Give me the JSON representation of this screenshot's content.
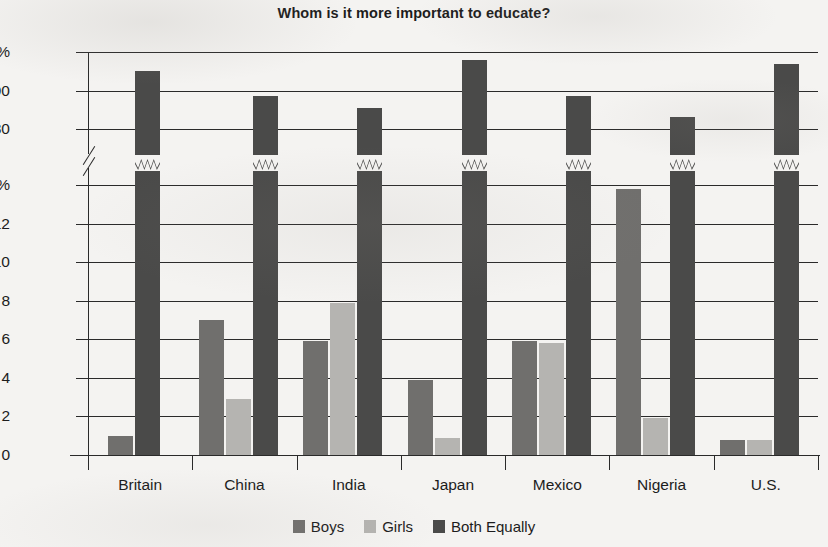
{
  "chart_data": {
    "type": "bar",
    "title": "Whom is it more important to educate?",
    "xlabel": "",
    "ylabel": "",
    "grid": true,
    "legend_position": "bottom-center",
    "orientation": "vertical",
    "grouping": "grouped",
    "broken_axis": true,
    "axis_note": "Y axis is broken: lower section spans 0-14%, upper section spans 80-100%. Tall 'Both Equally' bars are drawn with a zigzag break mark.",
    "lower_ylim": [
      0,
      14
    ],
    "upper_ylim": [
      80,
      100
    ],
    "lower_ticks": [
      0,
      2,
      4,
      6,
      8,
      10,
      12,
      14
    ],
    "upper_ticks": [
      80,
      90,
      100
    ],
    "ytick_labels": [
      "100%",
      "90",
      "80",
      "14%",
      "12",
      "10",
      "8",
      "6",
      "4",
      "2",
      "0"
    ],
    "categories": [
      "Britain",
      "China",
      "India",
      "Japan",
      "Mexico",
      "Nigeria",
      "U.S."
    ],
    "series": [
      {
        "name": "Boys",
        "color": "#706f6d",
        "values": [
          1.0,
          7.0,
          5.9,
          3.9,
          5.9,
          13.8,
          0.8
        ]
      },
      {
        "name": "Girls",
        "color": "#b5b4b1",
        "values": [
          0.0,
          2.9,
          7.9,
          0.9,
          5.8,
          1.9,
          0.8
        ]
      },
      {
        "name": "Both Equally",
        "color": "#4a4a49",
        "values": [
          95.0,
          88.5,
          85.5,
          98.0,
          88.5,
          83.0,
          97.0
        ]
      }
    ]
  },
  "legend": {
    "items": [
      {
        "label": "Boys",
        "color": "#706f6d"
      },
      {
        "label": "Girls",
        "color": "#b5b4b1"
      },
      {
        "label": "Both Equally",
        "color": "#4a4a49"
      }
    ]
  },
  "colors": {
    "axis": "#2a2a2a",
    "background": "#f4f3f1",
    "text": "#1c1c1c"
  }
}
